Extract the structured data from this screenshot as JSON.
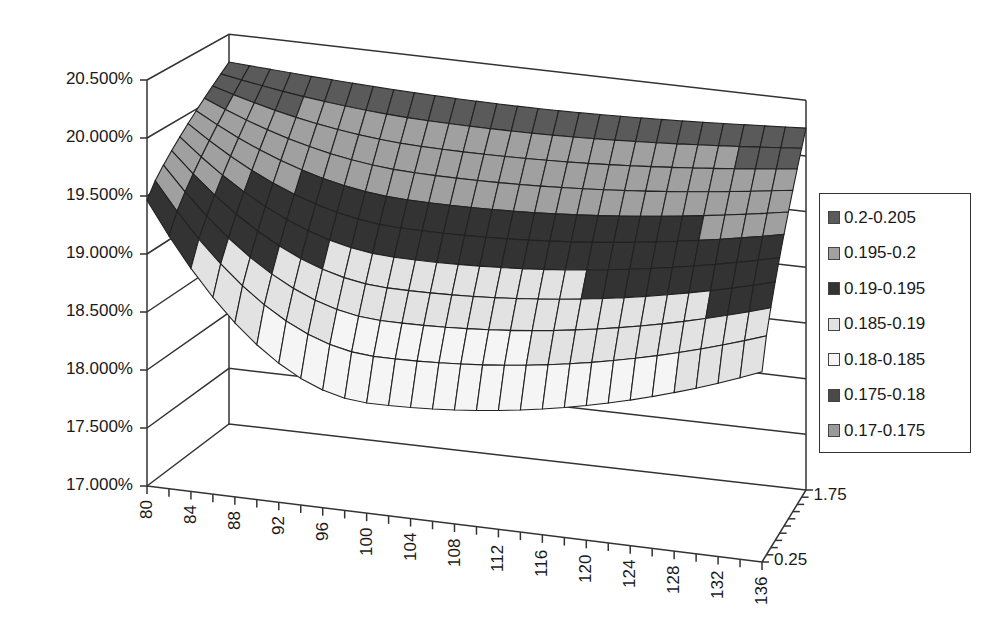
{
  "chart_data": {
    "type": "surface3d",
    "title": "",
    "xlabel": "",
    "ylabel": "",
    "zlabel": "",
    "x_ticks": [
      "80",
      "84",
      "88",
      "92",
      "96",
      "100",
      "104",
      "108",
      "112",
      "116",
      "120",
      "124",
      "128",
      "132",
      "136"
    ],
    "x_values_step": 2,
    "x_range": [
      80,
      136
    ],
    "depth_ticks": [
      "0.25",
      "1.75"
    ],
    "y_ticks": [
      "20.500%",
      "20.000%",
      "19.500%",
      "19.000%",
      "18.500%",
      "18.000%",
      "17.500%",
      "17.000%"
    ],
    "ylim": [
      0.17,
      0.205
    ],
    "legend": [
      {
        "label": "0.2-0.205",
        "color": "#5a5a5a"
      },
      {
        "label": "0.195-0.2",
        "color": "#a0a0a0"
      },
      {
        "label": "0.19-0.195",
        "color": "#333333"
      },
      {
        "label": "0.185-0.19",
        "color": "#e2e2e2"
      },
      {
        "label": "0.18-0.185",
        "color": "#f5f5f5"
      },
      {
        "label": "0.175-0.18",
        "color": "#4a4a4a"
      },
      {
        "label": "0.17-0.175",
        "color": "#9a9a9a"
      }
    ],
    "legend_position": "right",
    "grid": true,
    "surface_description": {
      "front_edge_depth_0.25": {
        "x": [
          80,
          100,
          136
        ],
        "approx_value": [
          0.191,
          0.1795,
          0.186
        ]
      },
      "back_edge_depth_1.75": {
        "x": [
          80,
          100,
          136
        ],
        "approx_value": [
          0.2025,
          0.2015,
          0.2025
        ]
      },
      "min_value_approx": 0.179,
      "max_value_approx": 0.203
    }
  }
}
